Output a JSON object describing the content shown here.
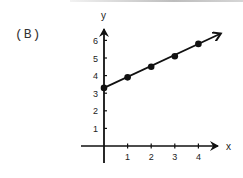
{
  "figure": {
    "panel_label": "(B)"
  },
  "chart_data": {
    "type": "line",
    "title": "",
    "panel_label": "(B)",
    "xlabel": "x",
    "ylabel": "y",
    "x_ticks": [
      "1",
      "2",
      "3",
      "4"
    ],
    "y_ticks": [
      "1",
      "2",
      "3",
      "4",
      "5",
      "6"
    ],
    "xlim": [
      -1.2,
      5.3
    ],
    "ylim": [
      -0.9,
      6.7
    ],
    "grid": false,
    "legend": null,
    "series": [
      {
        "name": "line",
        "x": [
          0,
          1,
          2,
          3,
          4
        ],
        "y": [
          3.3,
          3.9,
          4.5,
          5.1,
          5.8
        ],
        "markers": true,
        "arrow_end": true
      }
    ],
    "annotations": [
      "Line extends beyond last point with arrowhead; axes drawn with arrowheads on positive ends"
    ]
  }
}
